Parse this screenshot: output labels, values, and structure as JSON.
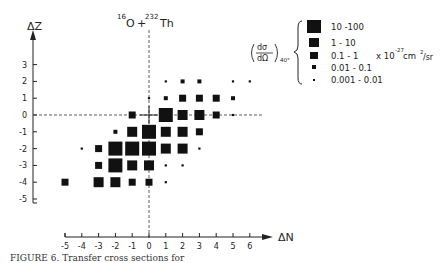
{
  "chart_data": {
    "type": "scatter",
    "title_parts": {
      "a_mass": "16",
      "a_sym": "O",
      "plus": "+",
      "b_mass": "232",
      "b_sym": "Th"
    },
    "xlabel": "ΔN",
    "ylabel": "ΔZ",
    "x_ticks": [
      -5,
      -4,
      -3,
      -2,
      -1,
      0,
      1,
      2,
      3,
      4,
      5,
      6
    ],
    "y_ticks": [
      3,
      2,
      1,
      0,
      -1,
      -2,
      -3,
      -4,
      -5
    ],
    "xlim": [
      -5,
      6
    ],
    "ylim": [
      -5,
      3.5
    ],
    "grid": false,
    "crosshair_dashed_at": {
      "x": 0,
      "y": 0
    },
    "legend": {
      "quantity": "(dσ/dΩ) 40°",
      "quantity_num": "dσ",
      "quantity_den": "dΩ",
      "quantity_sub": "40°",
      "unit": "x 10⁻²⁷ cm²/sr",
      "unit_parts": {
        "prefix": "x 10",
        "exp": "-27",
        "mid": " cm",
        "sq": "2",
        "suffix": "/sr"
      },
      "position": "upper right",
      "bins": [
        {
          "level": 5,
          "label": "10 -100"
        },
        {
          "level": 4,
          "label": "1 - 10"
        },
        {
          "level": 3,
          "label": "0.1 - 1"
        },
        {
          "level": 2,
          "label": "0.01 - 0.1"
        },
        {
          "level": 1,
          "label": "0.001 - 0.01"
        }
      ]
    },
    "points_note": "level: 5=10-100, 4=1-10, 3=0.1-1, 2=0.01-0.1, 1=0.001-0.01",
    "points": [
      {
        "dN": 1,
        "dZ": 2,
        "level": 1
      },
      {
        "dN": 2,
        "dZ": 2,
        "level": 2
      },
      {
        "dN": 3,
        "dZ": 2,
        "level": 2
      },
      {
        "dN": 5,
        "dZ": 2,
        "level": 1
      },
      {
        "dN": 6,
        "dZ": 2,
        "level": 1
      },
      {
        "dN": 0,
        "dZ": 1,
        "level": 1
      },
      {
        "dN": 1,
        "dZ": 1,
        "level": 2
      },
      {
        "dN": 2,
        "dZ": 1,
        "level": 3
      },
      {
        "dN": 3,
        "dZ": 1,
        "level": 3
      },
      {
        "dN": 4,
        "dZ": 1,
        "level": 3
      },
      {
        "dN": 5,
        "dZ": 1,
        "level": 2
      },
      {
        "dN": -1,
        "dZ": 0,
        "level": 3
      },
      {
        "dN": 1,
        "dZ": 0,
        "level": 5
      },
      {
        "dN": 2,
        "dZ": 0,
        "level": 4
      },
      {
        "dN": 3,
        "dZ": 0,
        "level": 4
      },
      {
        "dN": 4,
        "dZ": 0,
        "level": 3
      },
      {
        "dN": 5,
        "dZ": 0,
        "level": 1
      },
      {
        "dN": -2,
        "dZ": -1,
        "level": 2
      },
      {
        "dN": -1,
        "dZ": -1,
        "level": 4
      },
      {
        "dN": 0,
        "dZ": -1,
        "level": 5
      },
      {
        "dN": 1,
        "dZ": -1,
        "level": 4
      },
      {
        "dN": 2,
        "dZ": -1,
        "level": 4
      },
      {
        "dN": 3,
        "dZ": -1,
        "level": 3
      },
      {
        "dN": -4,
        "dZ": -2,
        "level": 1
      },
      {
        "dN": -3,
        "dZ": -2,
        "level": 3
      },
      {
        "dN": -2,
        "dZ": -2,
        "level": 5
      },
      {
        "dN": -1,
        "dZ": -2,
        "level": 5
      },
      {
        "dN": 0,
        "dZ": -2,
        "level": 5
      },
      {
        "dN": 1,
        "dZ": -2,
        "level": 4
      },
      {
        "dN": 2,
        "dZ": -2,
        "level": 4
      },
      {
        "dN": 3,
        "dZ": -2,
        "level": 1
      },
      {
        "dN": -3,
        "dZ": -3,
        "level": 3
      },
      {
        "dN": -2,
        "dZ": -3,
        "level": 5
      },
      {
        "dN": -1,
        "dZ": -3,
        "level": 4
      },
      {
        "dN": 0,
        "dZ": -3,
        "level": 4
      },
      {
        "dN": 1,
        "dZ": -3,
        "level": 1
      },
      {
        "dN": 2,
        "dZ": -3,
        "level": 1
      },
      {
        "dN": -5,
        "dZ": -4,
        "level": 3
      },
      {
        "dN": -3,
        "dZ": -4,
        "level": 4
      },
      {
        "dN": -2,
        "dZ": -4,
        "level": 4
      },
      {
        "dN": -1,
        "dZ": -4,
        "level": 3
      },
      {
        "dN": 0,
        "dZ": -4,
        "level": 3
      },
      {
        "dN": 1,
        "dZ": -4,
        "level": 1
      }
    ]
  },
  "caption": "FIGURE 6. Transfer cross sections for"
}
